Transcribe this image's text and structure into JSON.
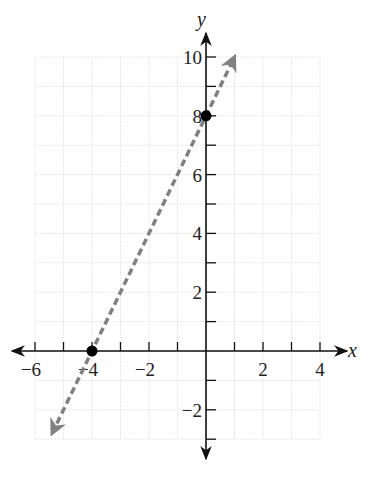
{
  "chart_data": {
    "type": "line",
    "title": "",
    "xlabel": "x",
    "ylabel": "y",
    "xlim": [
      -6,
      4
    ],
    "ylim": [
      -3,
      10
    ],
    "grid": true,
    "x_ticks": [
      -6,
      -5,
      -4,
      -3,
      -2,
      -1,
      1,
      2,
      3,
      4
    ],
    "x_tick_labels": [
      "−6",
      "−4",
      "−2",
      "2",
      "4"
    ],
    "x_labeled_values": [
      -6,
      -4,
      -2,
      2,
      4
    ],
    "y_ticks": [
      -3,
      -2,
      -1,
      1,
      2,
      3,
      4,
      5,
      6,
      7,
      8,
      9,
      10
    ],
    "y_tick_labels": [
      "−2",
      "2",
      "4",
      "6",
      "8",
      "10"
    ],
    "y_labeled_values": [
      -2,
      2,
      4,
      6,
      8,
      10
    ],
    "series": [
      {
        "name": "y = 2x + 8",
        "style": "dashed",
        "color": "#808080",
        "arrows": "both",
        "x": [
          -5.4,
          1
        ],
        "y": [
          -2.8,
          10
        ]
      }
    ],
    "points": [
      {
        "label": "y-intercept",
        "x": 0,
        "y": 8
      },
      {
        "label": "x-intercept",
        "x": -4,
        "y": 0
      }
    ]
  },
  "colors": {
    "axis": "#111111",
    "grid": "#e4e4e4",
    "line": "#808080",
    "point": "#000000"
  }
}
